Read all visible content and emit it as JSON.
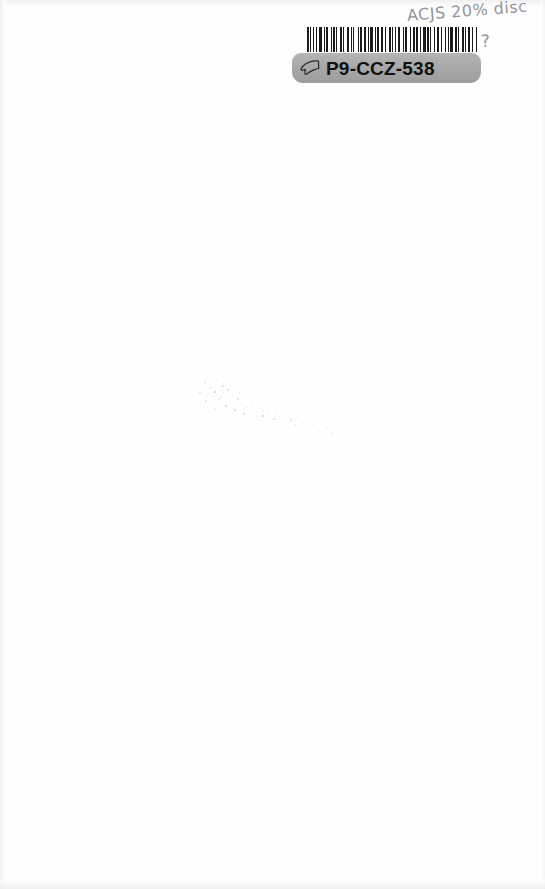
{
  "page": {
    "background_color": "#fefefe",
    "width": 545,
    "height": 889
  },
  "annotation": {
    "handwritten_note": "ACJS 20% disc",
    "handwritten_query": "?",
    "ink_color": "#8d8d92"
  },
  "sticker": {
    "id_code": "P9-CCZ-538",
    "icon_name": "pointing-hand-icon",
    "label_color": "#a9a9a9",
    "text_color": "#111111",
    "barcode": {
      "name": "barcode",
      "encoded_value": "P9-CCZ-538",
      "bar_color": "#1b1b1b",
      "background_color": "#ffffff",
      "pattern": [
        2,
        2,
        1,
        2,
        2,
        3,
        1,
        2,
        4,
        2,
        1,
        2,
        3,
        3,
        1,
        2,
        2,
        2,
        1,
        4,
        2,
        2,
        1,
        3,
        3,
        2,
        1,
        2,
        2,
        4,
        1,
        2,
        3,
        2,
        2,
        3,
        1,
        2,
        4,
        2,
        1,
        2,
        2,
        3,
        2,
        2,
        1,
        4,
        3,
        2,
        1,
        2,
        2,
        2,
        3,
        3,
        1,
        2,
        2,
        4,
        1,
        3,
        2,
        2,
        2,
        3,
        1,
        2,
        4,
        2,
        2,
        2,
        1,
        3,
        2,
        2,
        3,
        2,
        1,
        4,
        2,
        2,
        1,
        2,
        3,
        3,
        2,
        2,
        1,
        4,
        2,
        2,
        1,
        3,
        2,
        2,
        2,
        3,
        1,
        2
      ]
    }
  },
  "artifacts": {
    "speckle_trail_name": "faint-speckle-trail",
    "speckle_color": "#b9b9bf",
    "specks": [
      [
        8,
        4,
        2,
        2
      ],
      [
        14,
        9,
        1,
        1
      ],
      [
        20,
        2,
        1,
        1
      ],
      [
        26,
        7,
        2,
        2
      ],
      [
        3,
        14,
        2,
        2
      ],
      [
        11,
        17,
        1,
        1
      ],
      [
        18,
        13,
        2,
        2
      ],
      [
        24,
        19,
        1,
        1
      ],
      [
        31,
        11,
        2,
        2
      ],
      [
        36,
        16,
        1,
        1
      ],
      [
        9,
        22,
        2,
        2
      ],
      [
        16,
        25,
        1,
        1
      ],
      [
        22,
        21,
        1,
        1
      ],
      [
        29,
        27,
        2,
        2
      ],
      [
        34,
        23,
        1,
        1
      ],
      [
        41,
        20,
        2,
        2
      ],
      [
        45,
        26,
        1,
        1
      ],
      [
        38,
        31,
        2,
        2
      ],
      [
        50,
        29,
        1,
        1
      ],
      [
        55,
        24,
        1,
        1
      ],
      [
        47,
        35,
        2,
        2
      ],
      [
        58,
        33,
        1,
        1
      ],
      [
        63,
        30,
        1,
        1
      ],
      [
        66,
        37,
        2,
        2
      ],
      [
        72,
        34,
        1,
        1
      ],
      [
        77,
        40,
        2,
        2
      ],
      [
        83,
        38,
        1,
        1
      ],
      [
        88,
        43,
        1,
        1
      ],
      [
        94,
        41,
        2,
        2
      ],
      [
        99,
        46,
        1,
        1
      ],
      [
        105,
        44,
        1,
        1
      ],
      [
        111,
        48,
        1,
        1
      ],
      [
        117,
        46,
        1,
        1
      ],
      [
        123,
        51,
        1,
        1
      ],
      [
        130,
        49,
        1,
        1
      ],
      [
        136,
        54,
        1,
        1
      ],
      [
        142,
        52,
        1,
        1
      ],
      [
        6,
        9,
        1,
        1
      ],
      [
        13,
        4,
        1,
        1
      ],
      [
        27,
        14,
        1,
        1
      ],
      [
        33,
        6,
        1,
        1
      ],
      [
        19,
        30,
        1,
        1
      ],
      [
        43,
        14,
        1,
        1
      ],
      [
        52,
        19,
        1,
        1
      ],
      [
        61,
        42,
        1,
        1
      ],
      [
        70,
        28,
        1,
        1
      ],
      [
        80,
        33,
        1,
        1
      ],
      [
        90,
        36,
        1,
        1
      ],
      [
        101,
        39,
        1,
        1
      ],
      [
        113,
        55,
        1,
        1
      ]
    ]
  }
}
